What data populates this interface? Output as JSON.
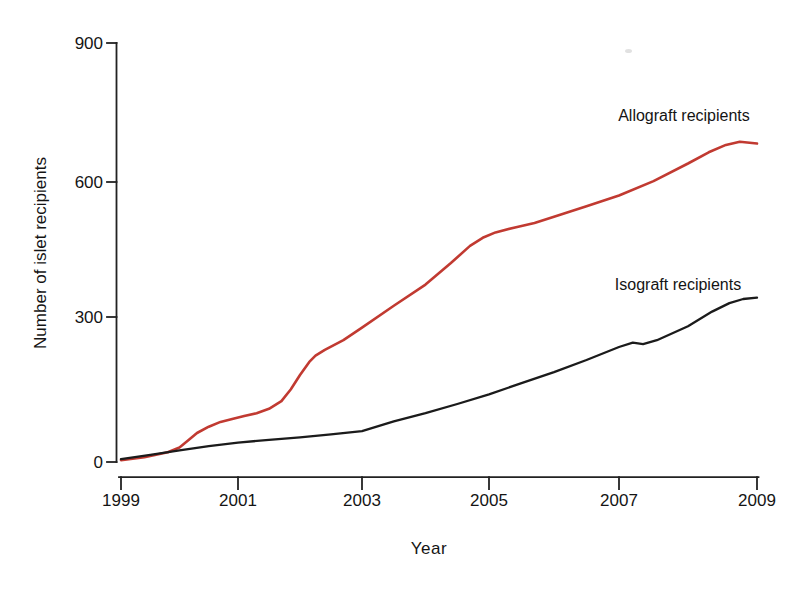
{
  "chart_data": {
    "type": "line",
    "title": "",
    "xlabel": "Year",
    "ylabel": "Number of islet recipients",
    "x_ticks": [
      1999,
      2001,
      2003,
      2005,
      2007,
      2009
    ],
    "y_ticks": [
      0,
      300,
      600,
      900
    ],
    "xlim": [
      1999,
      2009
    ],
    "ylim": [
      0,
      900
    ],
    "grid": false,
    "legend_position": "inline-labels-right",
    "series": [
      {
        "name": "Allograft recipients",
        "color": "#c13a31",
        "points": [
          [
            1999.0,
            4
          ],
          [
            1999.4,
            10
          ],
          [
            1999.8,
            20
          ],
          [
            2000.0,
            30
          ],
          [
            2000.15,
            45
          ],
          [
            2000.3,
            60
          ],
          [
            2000.5,
            73
          ],
          [
            2000.7,
            83
          ],
          [
            2000.9,
            89
          ],
          [
            2001.1,
            95
          ],
          [
            2001.3,
            101
          ],
          [
            2001.5,
            110
          ],
          [
            2001.7,
            126
          ],
          [
            2001.85,
            150
          ],
          [
            2002.0,
            180
          ],
          [
            2002.15,
            207
          ],
          [
            2002.25,
            220
          ],
          [
            2002.4,
            232
          ],
          [
            2002.7,
            252
          ],
          [
            2003.0,
            278
          ],
          [
            2003.5,
            325
          ],
          [
            2004.0,
            372
          ],
          [
            2004.4,
            420
          ],
          [
            2004.7,
            458
          ],
          [
            2004.9,
            476
          ],
          [
            2005.1,
            488
          ],
          [
            2005.4,
            499
          ],
          [
            2005.7,
            509
          ],
          [
            2006.0,
            523
          ],
          [
            2006.5,
            546
          ],
          [
            2007.0,
            570
          ],
          [
            2007.5,
            602
          ],
          [
            2008.0,
            640
          ],
          [
            2008.3,
            664
          ],
          [
            2008.55,
            680
          ],
          [
            2008.75,
            687
          ],
          [
            2009.0,
            683
          ]
        ]
      },
      {
        "name": "Isograft recipients",
        "color": "#1b1b1b",
        "points": [
          [
            1999.0,
            6
          ],
          [
            1999.5,
            15
          ],
          [
            2000.0,
            24
          ],
          [
            2000.5,
            33
          ],
          [
            2001.0,
            40
          ],
          [
            2001.5,
            46
          ],
          [
            2002.0,
            51
          ],
          [
            2002.5,
            57
          ],
          [
            2003.0,
            64
          ],
          [
            2003.5,
            84
          ],
          [
            2004.0,
            101
          ],
          [
            2004.5,
            120
          ],
          [
            2005.0,
            140
          ],
          [
            2005.5,
            163
          ],
          [
            2006.0,
            186
          ],
          [
            2006.5,
            211
          ],
          [
            2007.0,
            238
          ],
          [
            2007.2,
            247
          ],
          [
            2007.35,
            244
          ],
          [
            2007.55,
            252
          ],
          [
            2008.0,
            281
          ],
          [
            2008.35,
            312
          ],
          [
            2008.6,
            331
          ],
          [
            2008.8,
            340
          ],
          [
            2009.0,
            343
          ]
        ]
      }
    ],
    "axis_pixel_anchors": {
      "x_tick_px": [
        121,
        238,
        362,
        489,
        619,
        757
      ],
      "y_tick_px": [
        462,
        317,
        182,
        43
      ]
    }
  }
}
